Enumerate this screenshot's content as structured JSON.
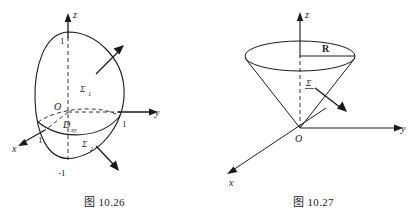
{
  "page": {
    "background": "#ffffff",
    "ink": "#1a1a1a",
    "width": 418,
    "height": 215
  },
  "figures": [
    {
      "id": "fig-10-26",
      "caption_prefix": "图",
      "caption_number": "10.26",
      "caption": "图 10.26",
      "description": "unit-sphere-split-into-upper-and-lower-surfaces",
      "axes": {
        "z_label": "z",
        "y_label": "y",
        "x_label": "x",
        "origin_label": "O"
      },
      "ticks": {
        "z_top": "1",
        "z_bottom": "-1",
        "y_one": "1",
        "x_one": "1"
      },
      "surfaces": {
        "upper_label": "Σ",
        "upper_sub": "1",
        "lower_label": "Σ",
        "lower_sub": "2"
      },
      "region": {
        "label": "D",
        "sub": "xy"
      }
    },
    {
      "id": "fig-10-27",
      "caption_prefix": "图",
      "caption_number": "10.27",
      "caption": "图 10.27",
      "description": "cone-with-apex-at-origin-opening-upward-radius-R",
      "axes": {
        "z_label": "z",
        "y_label": "y",
        "x_label": "x",
        "origin_label": "O"
      },
      "radius_label": "R",
      "surface_label": "Σ"
    }
  ]
}
